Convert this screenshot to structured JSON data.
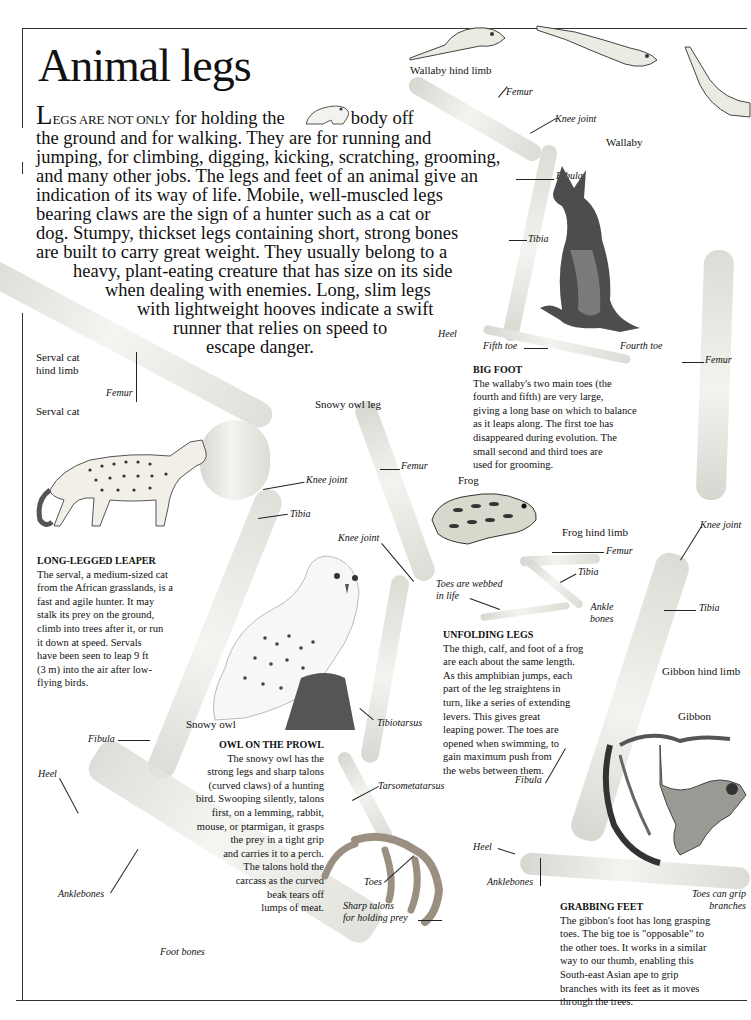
{
  "page": {
    "title": "Animal legs",
    "intro": {
      "dropcap": "L",
      "smallcaps": "EGS ARE NOT ONLY",
      "lines": [
        "for holding the",
        "body off",
        "the ground and for walking. They are for running and",
        "jumping, for climbing, digging, kicking, scratching, grooming,",
        "and many other jobs. The legs and feet of an animal give an",
        "indication of its way of life. Mobile, well-muscled legs",
        "bearing claws are the sign of a hunter such as a cat or",
        "dog. Stumpy, thickset legs containing short, strong bones",
        "are built to carry great weight. They usually belong to a",
        "heavy, plant-eating creature that has size on its side",
        "when dealing with enemies. Long, slim legs",
        "with lightweight hooves indicate a swift",
        "runner that relies on speed to",
        "escape danger."
      ]
    }
  },
  "illustrations": {
    "frog_sequence": [
      "frog-leaping-1",
      "frog-leaping-2",
      "frog-leaping-3"
    ],
    "inline_frog": "frog-sitting"
  },
  "wallaby": {
    "limb_caption": "Wallaby hind limb",
    "animal_caption": "Wallaby",
    "labels": {
      "femur": "Femur",
      "knee": "Knee joint",
      "fibula": "Fibula",
      "tibia": "Tibia",
      "heel": "Heel",
      "fifth_toe": "Fifth toe",
      "fourth_toe": "Fourth toe"
    },
    "box": {
      "heading": "BIG FOOT",
      "lines": [
        "The wallaby's two main toes (the",
        "fourth and fifth) are very large,",
        "giving a long base on which to balance",
        "as it leaps along. The first toe has",
        "disappeared during evolution. The",
        "small second and third toes are",
        "used for grooming."
      ]
    }
  },
  "serval": {
    "limb_caption": [
      "Serval cat",
      "hind limb"
    ],
    "animal_caption": "Serval cat",
    "labels": {
      "femur": "Femur",
      "knee": "Knee joint",
      "tibia": "Tibia",
      "fibula": "Fibula",
      "heel": "Heel",
      "anklebones": "Anklebones",
      "foot_bones": "Foot bones"
    },
    "box": {
      "heading": "LONG-LEGGED LEAPER",
      "lines": [
        "The serval, a medium-sized cat",
        "from the African grasslands, is a",
        "fast and agile hunter. It may",
        "stalk its prey on the ground,",
        "climb into trees after it, or run",
        "it down at speed. Servals",
        "have been seen to leap 9 ft",
        "(3 m) into the air after low-",
        "flying birds."
      ]
    }
  },
  "owl": {
    "limb_caption": "Snowy owl leg",
    "animal_caption": "Snowy owl",
    "labels": {
      "femur": "Femur",
      "knee": "Knee joint",
      "tibiotarsus": "Tibiotarsus",
      "tarsometatarsus": "Tarsometatarsus",
      "toes": "Toes",
      "talons": [
        "Sharp talons",
        "for holding prey"
      ]
    },
    "box": {
      "heading": "OWL ON THE PROWL",
      "lines": [
        "The snowy owl has the",
        "strong legs and sharp talons",
        "(curved claws) of a hunting",
        "bird. Swooping silently, talons",
        "first, on a lemming, rabbit,",
        "mouse, or ptarmigan, it grasps",
        "the prey in a tight grip",
        "and carries it to a perch.",
        "The talons hold the",
        "carcass as the curved",
        "beak tears off",
        "lumps of meat."
      ]
    }
  },
  "frog": {
    "animal_caption": "Frog",
    "limb_caption": "Frog hind limb",
    "labels": {
      "femur": "Femur",
      "tibia": "Tibia",
      "ankle": [
        "Ankle",
        "bones"
      ],
      "webbed": [
        "Toes are webbed",
        "in life"
      ]
    },
    "box": {
      "heading": "UNFOLDING LEGS",
      "lines": [
        "The thigh, calf, and foot of a frog",
        "are each about the same length.",
        "As this amphibian jumps, each",
        "part of the leg straightens in",
        "turn, like a series of extending",
        "levers. This gives great",
        "leaping power. The toes are",
        "opened when swimming, to",
        "gain maximum push from",
        "the webs between them."
      ]
    }
  },
  "gibbon": {
    "limb_caption": "Gibbon hind limb",
    "animal_caption": "Gibbon",
    "labels": {
      "femur": "Femur",
      "knee": "Knee joint",
      "tibia": "Tibia",
      "fibula": "Fibula",
      "heel": "Heel",
      "anklebones": "Anklebones",
      "grip": [
        "Toes can grip",
        "branches"
      ]
    },
    "box": {
      "heading": "GRABBING FEET",
      "lines": [
        "The gibbon's foot has long grasping",
        "toes. The big toe is \"opposable\" to",
        "the other toes. It works in a similar",
        "way to our thumb, enabling this",
        "South-east Asian ape to grip",
        "branches with its feet as it moves",
        "through the trees."
      ]
    }
  }
}
